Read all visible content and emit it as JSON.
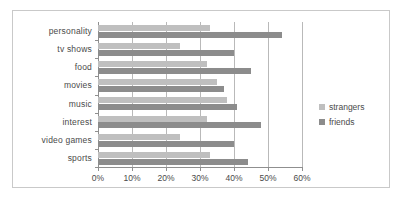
{
  "chart_data": {
    "type": "bar",
    "orientation": "horizontal",
    "title": "",
    "xlabel": "",
    "ylabel": "",
    "xlim": [
      0,
      60
    ],
    "grid": true,
    "legend_position": "right",
    "categories": [
      "personality",
      "tv shows",
      "food",
      "movies",
      "music",
      "interest",
      "video games",
      "sports"
    ],
    "xtick_labels": [
      "0%",
      "10%",
      "20%",
      "30%",
      "40%",
      "50%",
      "60%"
    ],
    "xticks": [
      0,
      10,
      20,
      30,
      40,
      50,
      60
    ],
    "series": [
      {
        "name": "strangers",
        "color": "#bfbfbf",
        "values": [
          33,
          24,
          32,
          35,
          38,
          32,
          24,
          33
        ]
      },
      {
        "name": "friends",
        "color": "#8c8c8c",
        "values": [
          54,
          40,
          45,
          37,
          41,
          48,
          40,
          44
        ]
      }
    ]
  },
  "legend": {
    "items": [
      {
        "label": "strangers",
        "color": "#bfbfbf"
      },
      {
        "label": "friends",
        "color": "#8c8c8c"
      }
    ]
  }
}
